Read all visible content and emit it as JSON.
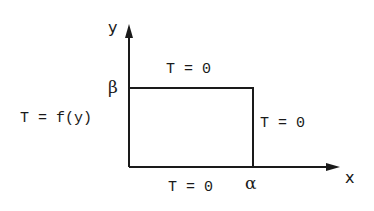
{
  "diagram": {
    "type": "rectangular-domain-boundary-conditions",
    "axes": {
      "x_label": "x",
      "y_label": "y"
    },
    "corners": {
      "x_extent_label": "α",
      "y_extent_label": "β"
    },
    "boundary_conditions": {
      "top": "T = 0",
      "bottom": "T = 0",
      "right": "T = 0",
      "left": "T = f(y)"
    },
    "colors": {
      "line": "#1a1a1a",
      "background": "#ffffff"
    }
  }
}
